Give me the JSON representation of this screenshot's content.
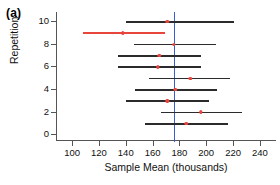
{
  "figure": {
    "panel_label": "(a)",
    "background": "#ffffff"
  },
  "chart_data": {
    "type": "scatter",
    "title": "",
    "xlabel": "Sample Mean (thousands)",
    "ylabel": "Repetition",
    "xlim": [
      88,
      252
    ],
    "ylim": [
      -0.5,
      10.8
    ],
    "grid": false,
    "legend": null,
    "xticks": [
      100,
      120,
      140,
      160,
      180,
      200,
      220,
      240
    ],
    "xtick_labels": [
      "100",
      "120",
      "140",
      "160",
      "180",
      "200",
      "220",
      "240"
    ],
    "yticks": [
      0,
      2,
      4,
      6,
      8,
      10
    ],
    "ytick_labels": [
      "0",
      "2",
      "4",
      "6",
      "8",
      "10"
    ],
    "reference_line": {
      "value": 176,
      "orientation": "vertical",
      "color": "#3a5fcd",
      "label": "population mean"
    },
    "interval_color": "#2b2b2b",
    "miss_color": "#e8453c",
    "point_color": "#e8453c",
    "series": [
      {
        "name": "Confidence intervals",
        "points": [
          {
            "repetition": 10,
            "mean": 171,
            "lower": 140,
            "upper": 221,
            "covers": true,
            "color": "#2b2b2b"
          },
          {
            "repetition": 9,
            "mean": 138,
            "lower": 108,
            "upper": 169,
            "covers": false,
            "color": "#e8453c"
          },
          {
            "repetition": 8,
            "mean": 176,
            "lower": 146,
            "upper": 207,
            "covers": true,
            "color": "#2b2b2b"
          },
          {
            "repetition": 7,
            "mean": 165,
            "lower": 134,
            "upper": 196,
            "covers": true,
            "color": "#2b2b2b"
          },
          {
            "repetition": 6,
            "mean": 164,
            "lower": 134,
            "upper": 196,
            "covers": true,
            "color": "#2b2b2b"
          },
          {
            "repetition": 5,
            "mean": 188,
            "lower": 157,
            "upper": 218,
            "covers": true,
            "color": "#2b2b2b"
          },
          {
            "repetition": 4,
            "mean": 177,
            "lower": 147,
            "upper": 208,
            "covers": true,
            "color": "#2b2b2b"
          },
          {
            "repetition": 3,
            "mean": 171,
            "lower": 140,
            "upper": 202,
            "covers": true,
            "color": "#2b2b2b"
          },
          {
            "repetition": 2,
            "mean": 196,
            "lower": 166,
            "upper": 227,
            "covers": true,
            "color": "#2b2b2b"
          },
          {
            "repetition": 1,
            "mean": 185,
            "lower": 154,
            "upper": 216,
            "covers": true,
            "color": "#2b2b2b"
          }
        ]
      }
    ]
  }
}
